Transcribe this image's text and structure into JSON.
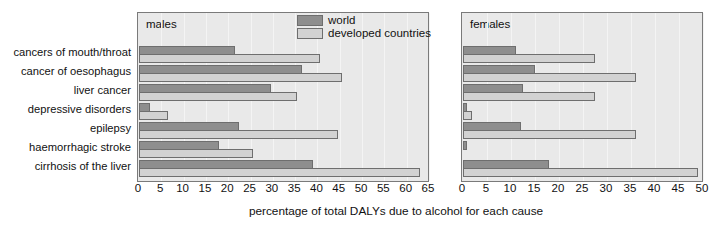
{
  "chart_data": {
    "type": "bar",
    "orientation": "horizontal",
    "title": "",
    "xlabel": "percentage of total DALYs due to alcohol for each cause",
    "ylabel": "",
    "grid": true,
    "legend": {
      "position": "top-right-of-left-panel",
      "entries": [
        {
          "name": "world",
          "color": "#8e8e8e"
        },
        {
          "name": "developed countries",
          "color": "#d2d2d2"
        }
      ]
    },
    "categories": [
      "cancers of mouth/throat",
      "cancer of oesophagus",
      "liver cancer",
      "depressive disorders",
      "epilepsy",
      "haemorrhagic stroke",
      "cirrhosis of the liver"
    ],
    "panels": [
      {
        "label": "males",
        "xlim": [
          0,
          65
        ],
        "xticks": [
          0,
          5,
          10,
          15,
          20,
          25,
          30,
          35,
          40,
          45,
          50,
          55,
          60,
          65
        ],
        "series": [
          {
            "name": "world",
            "values": [
              21.5,
              36.5,
              29.5,
              2.5,
              22.5,
              18.0,
              39.0
            ]
          },
          {
            "name": "developed countries",
            "values": [
              40.5,
              45.5,
              35.5,
              6.5,
              44.5,
              25.5,
              63.0
            ]
          }
        ]
      },
      {
        "label": "females",
        "xlim": [
          0,
          50
        ],
        "xticks": [
          0,
          5,
          10,
          15,
          20,
          25,
          30,
          35,
          40,
          45,
          50
        ],
        "series": [
          {
            "name": "world",
            "values": [
              11.0,
              15.0,
              12.5,
              0.8,
              12.0,
              0.8,
              18.0
            ]
          },
          {
            "name": "developed countries",
            "values": [
              27.5,
              36.0,
              27.5,
              1.8,
              36.0,
              0.0,
              49.0
            ]
          }
        ]
      }
    ]
  },
  "legend": {
    "world_label": "world",
    "developed_label": "developed countries"
  },
  "panels": {
    "males": {
      "title": "males"
    },
    "females": {
      "title": "females"
    }
  },
  "axis": {
    "title": "percentage of total DALYs due to alcohol for each cause"
  },
  "categories": [
    "cancers of mouth/throat",
    "cancer of oesophagus",
    "liver cancer",
    "depressive disorders",
    "epilepsy",
    "haemorrhagic stroke",
    "cirrhosis of the liver"
  ],
  "colors": {
    "world": "#8e8e8e",
    "developed": "#d2d2d2",
    "panel_background": "#e9e9e9",
    "panel_border": "#7a7a7a",
    "text": "#111111"
  }
}
